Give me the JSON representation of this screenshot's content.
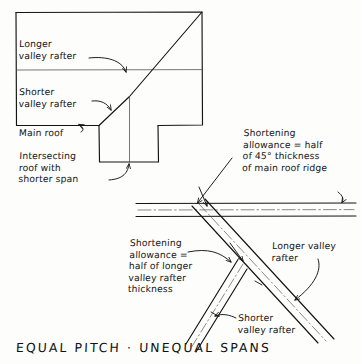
{
  "drawing": {
    "title": "EQUAL PITCH · UNEQUAL SPANS",
    "style": "hand-drawn architectural line drawing, black ink on white",
    "ink_color": "#141414",
    "paper_color": "#fdfdfc"
  },
  "plan_view": {
    "name": "roof plan of intersecting roofs",
    "labels": {
      "longer_valley_rafter": "Longer\nvalley rafter",
      "shorter_valley_rafter": "Shorter\nvalley rafter",
      "main_roof": "Main roof",
      "intersecting_roof": "Intersecting\nroof with\nshorter span"
    }
  },
  "detail_view": {
    "name": "ridge and valley rafter shortening detail",
    "labels": {
      "shortening_ridge": "Shortening\nallowance = half\nof 45° thickness\nof main roof ridge",
      "shortening_rafter": "Shortening\nallowance =\nhalf of longer\nvalley rafter\nthickness",
      "longer_valley_rafter": "Longer valley\nrafter",
      "shorter_valley_rafter": "Shorter\nvalley rafter"
    }
  }
}
